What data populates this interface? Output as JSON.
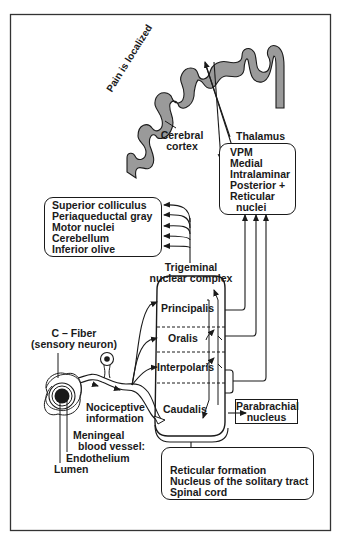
{
  "figure": {
    "cortex": {
      "side_label": "Pain is localized",
      "label_line1": "Cerebral",
      "label_line2": "cortex"
    },
    "thalamus": {
      "title": "Thalamus",
      "nuclei": [
        "VPM",
        "Medial",
        "Intralaminar",
        "Posterior +",
        "Reticular",
        "nuclei"
      ]
    },
    "brainstem_targets": [
      "Superior colliculus",
      "Periaqueductal gray",
      "Motor nuclei",
      "Cerebellum",
      "Inferior olive"
    ],
    "trigeminal": {
      "title_line1": "Trigeminal",
      "title_line2": "nuclear complex",
      "subnuclei": [
        "Principalis",
        "Oralis",
        "Interpolaris",
        "Caudalis"
      ]
    },
    "parabrachial": {
      "line1": "Parabrachial",
      "line2": "nucleus"
    },
    "descending_targets": [
      "Reticular formation",
      "Nucleus of the solitary tract",
      "Spinal cord"
    ],
    "c_fiber": {
      "line1": "C – Fiber",
      "line2": "(sensory neuron)"
    },
    "nociceptive": {
      "line1": "Nociceptive",
      "line2": "information"
    },
    "vessel": {
      "line1": "Meningeal",
      "line2": "blood vessel:",
      "endothelium": "Endothelium",
      "lumen": "Lumen"
    }
  },
  "colors": {
    "ink": "#1a1a1a",
    "cortex_fill": "#9a9a9a",
    "background": "#ffffff"
  }
}
